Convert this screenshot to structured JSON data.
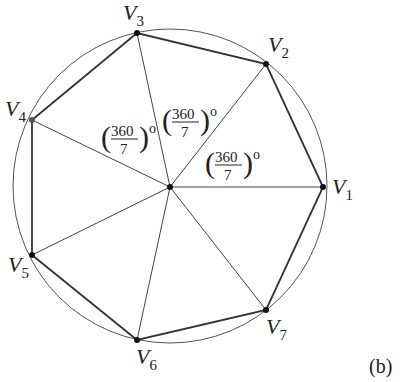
{
  "figure": {
    "caption": "(b)",
    "circle": {
      "cx": 170,
      "cy": 186,
      "r": 157
    },
    "center": {
      "x": 170,
      "y": 187
    },
    "vertices": [
      {
        "name": "V",
        "sub": "1",
        "x": 323,
        "y": 187
      },
      {
        "name": "V",
        "sub": "2",
        "x": 266,
        "y": 64
      },
      {
        "name": "V",
        "sub": "3",
        "x": 137,
        "y": 33
      },
      {
        "name": "V",
        "sub": "4",
        "x": 32,
        "y": 120
      },
      {
        "name": "V",
        "sub": "5",
        "x": 32,
        "y": 255
      },
      {
        "name": "V",
        "sub": "6",
        "x": 137,
        "y": 340
      },
      {
        "name": "V",
        "sub": "7",
        "x": 266,
        "y": 310
      }
    ],
    "angle_labels": [
      {
        "numerator": "360",
        "denominator": "7",
        "unit": "o"
      },
      {
        "numerator": "360",
        "denominator": "7",
        "unit": "o"
      },
      {
        "numerator": "360",
        "denominator": "7",
        "unit": "o"
      }
    ],
    "colors": {
      "stroke": "#333333",
      "text": "#222222"
    }
  }
}
